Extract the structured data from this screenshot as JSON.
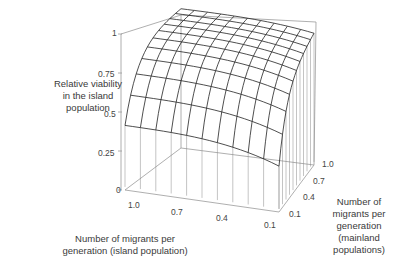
{
  "chart_data": {
    "type": "surface3d",
    "title": "",
    "zlabel": "Relative viability in the island population",
    "xlabel": "Number of migrants per generation (island population)",
    "ylabel": "Number of migrants per generation (mainland populations)",
    "zlim": [
      0,
      1
    ],
    "z_ticks": [
      "0",
      "0.25",
      "0.5",
      "0.75",
      "1"
    ],
    "x_ticks": [
      "1.0",
      "0.7",
      "0.4",
      "0.1"
    ],
    "y_ticks": [
      "0.1",
      "0.4",
      "0.7",
      "1.0"
    ],
    "x": [
      1.0,
      0.9,
      0.8,
      0.7,
      0.6,
      0.5,
      0.4,
      0.3,
      0.2,
      0.1
    ],
    "y": [
      0.1,
      0.2,
      0.3,
      0.4,
      0.5,
      0.6,
      0.7,
      0.8,
      0.9,
      1.0
    ],
    "grid": true
  },
  "labels": {
    "zlabel_lines": [
      "Relative viability",
      "in the island",
      "population"
    ],
    "xlabel_lines": [
      "Number of migrants per",
      "generation (island population)"
    ],
    "ylabel_lines": [
      "Number of",
      "migrants per",
      "generation",
      "(mainland",
      "populations)"
    ]
  }
}
